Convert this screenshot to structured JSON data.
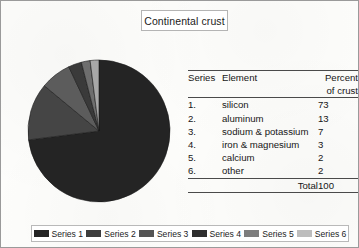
{
  "figure": {
    "title": "Continental crust",
    "background_color": "#fdfdfb",
    "border_color": "#9a9a9a"
  },
  "chart_data": {
    "type": "pie",
    "title": "Continental crust",
    "categories": [
      "silicon",
      "aluminum",
      "sodium & potassium",
      "iron & magnesium",
      "calcium",
      "other"
    ],
    "values": [
      73,
      13,
      7,
      3,
      2,
      2
    ],
    "unit": "percent of crust",
    "total": 100,
    "start_angle_deg": 0,
    "direction": "clockwise",
    "legend": {
      "position": "bottom",
      "entries": [
        "Series 1",
        "Series 2",
        "Series 3",
        "Series 4",
        "Series 5",
        "Series 6"
      ]
    },
    "slice_colors": [
      "#242424",
      "#454545",
      "#5c5c5c",
      "#3a3a3a",
      "#6e6e6e",
      "#a8a8a8"
    ],
    "grid": false
  },
  "table": {
    "headers": {
      "series": "Series",
      "element": "Element",
      "percent": "Percent of crust"
    },
    "rows": [
      {
        "series": "1.",
        "element": "silicon",
        "percent": "73"
      },
      {
        "series": "2.",
        "element": "aluminum",
        "percent": "13"
      },
      {
        "series": "3.",
        "element": "sodium & potassium",
        "percent": "7"
      },
      {
        "series": "4.",
        "element": "iron & magnesium",
        "percent": "3"
      },
      {
        "series": "5.",
        "element": "calcium",
        "percent": "2"
      },
      {
        "series": "6.",
        "element": "other",
        "percent": "2"
      }
    ],
    "total": {
      "label": "Total",
      "value": "100"
    }
  },
  "legend": {
    "items": [
      {
        "label": "Series 1",
        "color": "#242424"
      },
      {
        "label": "Series 2",
        "color": "#3d3d3d"
      },
      {
        "label": "Series 3",
        "color": "#545454"
      },
      {
        "label": "Series 4",
        "color": "#2e2e2e"
      },
      {
        "label": "Series 5",
        "color": "#7d7d7d"
      },
      {
        "label": "Series 6",
        "color": "#bdbdbd"
      }
    ]
  }
}
